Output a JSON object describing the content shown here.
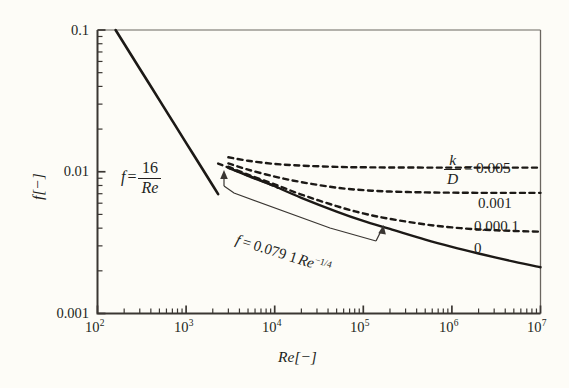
{
  "chart_data": {
    "type": "line",
    "title": "",
    "xlabel": "Re[−]",
    "ylabel": "f[−]",
    "xscale": "log",
    "yscale": "log",
    "xlim": [
      100,
      10000000
    ],
    "ylim": [
      0.001,
      0.1
    ],
    "grid": false,
    "legend": "inline-right",
    "xticks": [
      {
        "value": 100,
        "mantissa": "10",
        "exponent": "2"
      },
      {
        "value": 1000,
        "mantissa": "10",
        "exponent": "3"
      },
      {
        "value": 10000,
        "mantissa": "10",
        "exponent": "4"
      },
      {
        "value": 100000,
        "mantissa": "10",
        "exponent": "5"
      },
      {
        "value": 1000000,
        "mantissa": "10",
        "exponent": "6"
      },
      {
        "value": 10000000,
        "mantissa": "10",
        "exponent": "7"
      }
    ],
    "yticks": [
      {
        "value": 0.1,
        "label": "0.1"
      },
      {
        "value": 0.01,
        "label": "0.01"
      },
      {
        "value": 0.001,
        "label": "0.001"
      }
    ],
    "series": [
      {
        "name": "laminar",
        "style": "solid",
        "equation": "f = 16/Re",
        "points": [
          [
            160,
            0.1
          ],
          [
            200,
            0.08
          ],
          [
            300,
            0.05333
          ],
          [
            500,
            0.032
          ],
          [
            700,
            0.02286
          ],
          [
            1000,
            0.016
          ],
          [
            1500,
            0.01067
          ],
          [
            2000,
            0.008
          ],
          [
            2300,
            0.006957
          ]
        ]
      },
      {
        "name": "blasius",
        "style": "dashed",
        "equation": "f = 0.0791 Re^-1/4",
        "points": [
          [
            2300,
            0.01142
          ],
          [
            3000,
            0.01069
          ],
          [
            4000,
            0.00995
          ],
          [
            5000,
            0.00941
          ],
          [
            6000,
            0.00899
          ],
          [
            8000,
            0.00837
          ],
          [
            10000,
            0.00791
          ],
          [
            11000,
            0.0077
          ]
        ]
      },
      {
        "name": "kd-0",
        "label": "0",
        "style": "solid",
        "roughness": 0,
        "points": [
          [
            3000,
            0.01065
          ],
          [
            5000,
            0.00935
          ],
          [
            8000,
            0.00835
          ],
          [
            10000,
            0.0079
          ],
          [
            20000,
            0.00655
          ],
          [
            50000,
            0.00524
          ],
          [
            100000,
            0.0045
          ],
          [
            200000,
            0.00395
          ],
          [
            500000,
            0.00332
          ],
          [
            1000000,
            0.00295
          ],
          [
            2000000,
            0.00265
          ],
          [
            5000000,
            0.00232
          ],
          [
            10000000,
            0.00212
          ]
        ]
      },
      {
        "name": "kd-0.0001",
        "label": "0.000 1",
        "style": "dashed",
        "roughness": 0.0001,
        "points": [
          [
            3000,
            0.01085
          ],
          [
            5000,
            0.00955
          ],
          [
            10000,
            0.00815
          ],
          [
            20000,
            0.0069
          ],
          [
            50000,
            0.00572
          ],
          [
            100000,
            0.00508
          ],
          [
            200000,
            0.00465
          ],
          [
            500000,
            0.00425
          ],
          [
            1000000,
            0.00405
          ],
          [
            2000000,
            0.00392
          ],
          [
            5000000,
            0.00382
          ],
          [
            10000000,
            0.00378
          ]
        ]
      },
      {
        "name": "kd-0.001",
        "label": "0.001",
        "style": "dashed",
        "roughness": 0.001,
        "points": [
          [
            3000,
            0.01145
          ],
          [
            5000,
            0.01035
          ],
          [
            10000,
            0.00925
          ],
          [
            20000,
            0.00845
          ],
          [
            50000,
            0.00772
          ],
          [
            100000,
            0.00742
          ],
          [
            200000,
            0.00725
          ],
          [
            500000,
            0.00715
          ],
          [
            1000000,
            0.00712
          ],
          [
            2000000,
            0.0071
          ],
          [
            5000000,
            0.0071
          ],
          [
            10000000,
            0.0071
          ]
        ]
      },
      {
        "name": "kd-0.005",
        "label": "0.005",
        "style": "dashed",
        "roughness": 0.005,
        "points": [
          [
            3000,
            0.01265
          ],
          [
            5000,
            0.01195
          ],
          [
            10000,
            0.01135
          ],
          [
            20000,
            0.01105
          ],
          [
            50000,
            0.01082
          ],
          [
            100000,
            0.01075
          ],
          [
            200000,
            0.01072
          ],
          [
            500000,
            0.0107
          ],
          [
            1000000,
            0.0107
          ],
          [
            2000000,
            0.0107
          ],
          [
            5000000,
            0.0107
          ],
          [
            10000000,
            0.0107
          ]
        ]
      }
    ],
    "annotations": {
      "laminar_eq": {
        "f": "f",
        "eq": "=",
        "numerator": "16",
        "denominator": "Re"
      },
      "turbulent_eq": {
        "text": "f = 0.079 1Re",
        "f": "f",
        "eq": "=",
        "coefficient": "0.079 1",
        "re": "Re",
        "exponent": "−1/4"
      },
      "roughness_key": {
        "numerator": "k",
        "denominator": "D",
        "eq": "=",
        "value": "0.005"
      },
      "curve_labels": [
        "0.001",
        "0.000 1",
        "0"
      ]
    },
    "colors": {
      "background": "#fdfcf7",
      "ink": "#231f1c",
      "axis": "#3a3632"
    }
  }
}
